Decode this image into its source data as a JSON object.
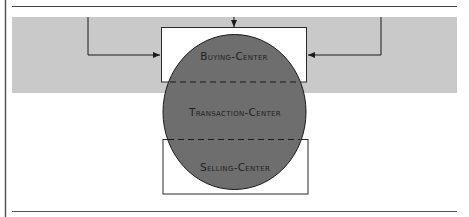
{
  "diagram": {
    "colors": {
      "band": "#c9c9c9",
      "circle": "#6e6e6e",
      "line": "#2a2a2a",
      "box_fill": "#ffffff",
      "frame_line": "#4a4a4a"
    },
    "labels": {
      "buying_center": "Buying-Center",
      "transaction_center": "Transaction-Center",
      "selling_center": "Selling-Center"
    }
  }
}
